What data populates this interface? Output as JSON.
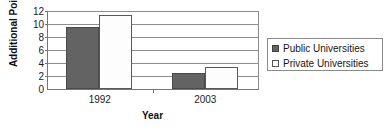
{
  "chart_data": {
    "type": "bar",
    "title": "",
    "categories": [
      "1992",
      "2003"
    ],
    "series": [
      {
        "name": "Public Universities",
        "values": [
          9.5,
          2.5
        ],
        "color": "#636363"
      },
      {
        "name": "Private Universities",
        "values": [
          11.4,
          3.4
        ],
        "color": "#ffffff"
      }
    ],
    "xlabel": "Year",
    "ylabel": "Additional Points",
    "ylim": [
      0,
      12
    ],
    "yticks": [
      "12",
      "10",
      "8",
      "6",
      "4",
      "2",
      "0"
    ],
    "ytick_values": [
      12,
      10,
      8,
      6,
      4,
      2,
      0
    ],
    "grid": true,
    "legend_position": "right"
  },
  "legend": {
    "entries": [
      {
        "label": "Public Universities",
        "swatch": "filled-square-dark"
      },
      {
        "label": "Private Universities",
        "swatch": "empty-square-white"
      }
    ]
  },
  "axes": {
    "y_title": "Additional Points",
    "x_title": "Year"
  }
}
